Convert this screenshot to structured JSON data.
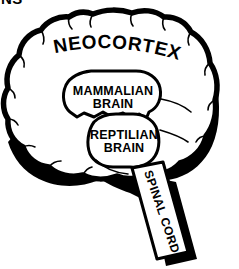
{
  "diagram": {
    "type": "anatomical-illustration",
    "colors": {
      "background": "#ffffff",
      "line": "#000000",
      "shadow": "#000000",
      "fill": "#ffffff"
    },
    "cropped_text_fragment": "NS",
    "labels": {
      "neocortex": "NEOCORTEX",
      "mammalian_line1": "MAMMALIAN",
      "mammalian_line2": "BRAIN",
      "reptilian_line1": "REPTILIAN",
      "reptilian_line2": "BRAIN",
      "spinal_cord": "SPINAL CORD"
    },
    "regions": [
      {
        "name": "neocortex",
        "label": "NEOCORTEX"
      },
      {
        "name": "mammalian-brain",
        "label": "MAMMALIAN BRAIN"
      },
      {
        "name": "reptilian-brain",
        "label": "REPTILIAN BRAIN"
      },
      {
        "name": "spinal-cord",
        "label": "SPINAL CORD"
      }
    ]
  }
}
